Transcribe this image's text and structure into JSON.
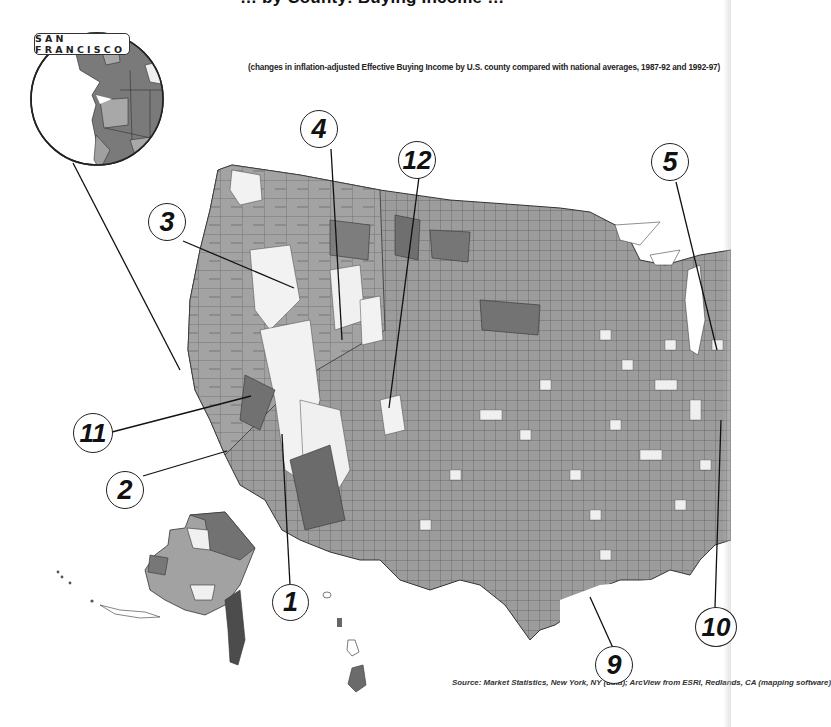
{
  "title_partial": "… by County: Buying Income …",
  "inset": {
    "label": "SAN FRANCISCO"
  },
  "subtitle": "(changes in inflation-adjusted Effective Buying Income by U.S. county compared with national averages, 1987-92 and 1992-97)",
  "source": "Source: Market Statistics, New York, NY (data); ArcView from ESRI, Redlands, CA (mapping software)",
  "callouts": [
    {
      "id": "1",
      "label": "1"
    },
    {
      "id": "2",
      "label": "2"
    },
    {
      "id": "3",
      "label": "3"
    },
    {
      "id": "4",
      "label": "4"
    },
    {
      "id": "5",
      "label": "5"
    },
    {
      "id": "9",
      "label": "9"
    },
    {
      "id": "10",
      "label": "10"
    },
    {
      "id": "11",
      "label": "11"
    },
    {
      "id": "12",
      "label": "12"
    }
  ],
  "colors": {
    "dark": "#6e6e6e",
    "medium": "#9a9a9a",
    "light": "#f2f2f2",
    "border": "#333333",
    "background": "#ffffff"
  },
  "map_regions": [
    "contiguous United States counties",
    "Alaska",
    "Hawaii",
    "San Francisco Bay Area inset"
  ]
}
